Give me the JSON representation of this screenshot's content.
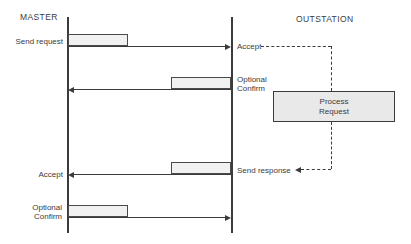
{
  "header": {
    "master_label": "MASTER",
    "outstation_label": "OUTSTATION"
  },
  "messages": [
    {
      "direction": "master-to-outstation",
      "master_label": "Send request",
      "outstation_label": "Accept"
    },
    {
      "direction": "outstation-to-master",
      "outstation_label_line1": "Optional",
      "outstation_label_line2": "Confirm"
    },
    {
      "direction": "outstation-to-master",
      "master_label": "Accept",
      "outstation_label": "Send response"
    },
    {
      "direction": "master-to-outstation",
      "master_label_line1": "Optional",
      "master_label_line2": "Confirm"
    }
  ],
  "process_box": {
    "line1": "Process",
    "line2": "Request"
  },
  "colors": {
    "background": "#ffffff",
    "line": "#3b3b3b",
    "text": "#3b3b3b",
    "bar_fill": "#f1f1f1",
    "bar_border": "#4a4a4a",
    "process_box_fill": "#e9e9e9"
  }
}
